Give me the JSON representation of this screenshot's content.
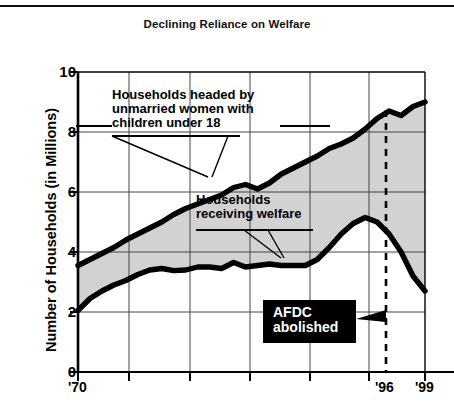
{
  "chart_data": {
    "type": "line",
    "title": "Declining Reliance on Welfare",
    "xlabel": "",
    "ylabel": "Number of Households (in Millions)",
    "ylim": [
      0,
      10
    ],
    "xlim": [
      1970,
      1999
    ],
    "yticks": [
      0,
      2,
      4,
      6,
      8,
      10
    ],
    "ytick_labels": [
      "0",
      "2",
      "4",
      "6",
      "8",
      "10"
    ],
    "xticks": [
      1970,
      1996,
      1999
    ],
    "xtick_labels": [
      "'70",
      "'96",
      "'99"
    ],
    "grid": true,
    "legend_position": "inline-annotations",
    "shaded_between_series": true,
    "shade_color": "#d2d2d2",
    "line_color": "#000000",
    "x": [
      1970,
      1971,
      1972,
      1973,
      1974,
      1975,
      1976,
      1977,
      1978,
      1979,
      1980,
      1981,
      1982,
      1983,
      1984,
      1985,
      1986,
      1987,
      1988,
      1989,
      1990,
      1991,
      1992,
      1993,
      1994,
      1995,
      1996,
      1997,
      1998,
      1999
    ],
    "series": [
      {
        "name": "Households headed by unmarried women with children under 18",
        "values": [
          3.55,
          3.75,
          3.95,
          4.15,
          4.4,
          4.6,
          4.8,
          5.0,
          5.25,
          5.45,
          5.6,
          5.75,
          5.9,
          6.15,
          6.25,
          6.1,
          6.3,
          6.6,
          6.8,
          7.0,
          7.2,
          7.45,
          7.6,
          7.8,
          8.1,
          8.45,
          8.7,
          8.55,
          8.85,
          9.0
        ]
      },
      {
        "name": "Households receiving welfare",
        "values": [
          2.05,
          2.45,
          2.7,
          2.9,
          3.05,
          3.25,
          3.4,
          3.45,
          3.38,
          3.4,
          3.5,
          3.5,
          3.45,
          3.65,
          3.5,
          3.55,
          3.6,
          3.55,
          3.55,
          3.55,
          3.75,
          4.15,
          4.6,
          4.95,
          5.15,
          5.0,
          4.6,
          4.0,
          3.2,
          2.7
        ]
      }
    ],
    "annotations": [
      {
        "id": "annotation-upper",
        "text": "Households headed by\nunmarried women with\nchildren under 18",
        "underline": true,
        "leader_lines": 2
      },
      {
        "id": "annotation-lower",
        "text": "Households\nreceiving welfare",
        "underline": true,
        "leader_lines": 2
      },
      {
        "id": "annotation-afdc",
        "text": "AFDC\nabolished",
        "style": "white-on-black-box",
        "pointer_to": "1996 dashed marker"
      }
    ],
    "markers": [
      {
        "id": "afdc-marker",
        "x": 1996,
        "style": "dashed-vertical",
        "label": "'96"
      }
    ]
  }
}
